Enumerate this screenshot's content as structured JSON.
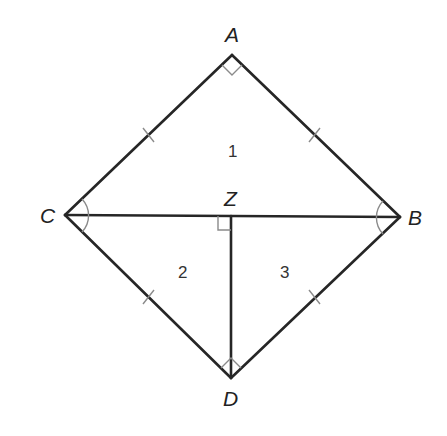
{
  "diagram": {
    "type": "geometry-figure",
    "vertices": {
      "A": {
        "label": "A",
        "x": 232,
        "y": 55
      },
      "B": {
        "label": "B",
        "x": 400,
        "y": 217
      },
      "C": {
        "label": "C",
        "x": 65,
        "y": 215
      },
      "D": {
        "label": "D",
        "x": 231,
        "y": 378
      },
      "Z": {
        "label": "Z",
        "x": 231,
        "y": 216
      }
    },
    "segments": [
      "AC",
      "AB",
      "CD",
      "BD",
      "CB",
      "ZD"
    ],
    "regions": {
      "r1": {
        "label": "1",
        "x": 233,
        "y": 153
      },
      "r2": {
        "label": "2",
        "x": 183,
        "y": 274
      },
      "r3": {
        "label": "3",
        "x": 285,
        "y": 274
      }
    },
    "markings": {
      "right_angles": [
        "A",
        "Z",
        "D"
      ],
      "angle_arcs": [
        "C",
        "B"
      ],
      "congruent_ticks": [
        "AC",
        "AB",
        "CD",
        "BD"
      ]
    },
    "colors": {
      "line": "#262626",
      "marking": "#8a8a8a",
      "background": "#ffffff"
    }
  }
}
